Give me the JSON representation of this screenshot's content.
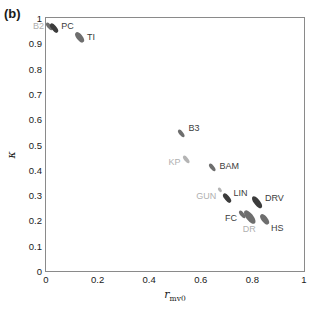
{
  "panel": {
    "label": "(b)"
  },
  "axes": {
    "xlabel_var": "r",
    "xlabel_sub": "mv0",
    "ylabel": "κ",
    "xticks": [
      "0",
      "0.2",
      "0.4",
      "0.6",
      "0.8",
      "1"
    ],
    "yticks": [
      "0",
      "0.1",
      "0.2",
      "0.3",
      "0.4",
      "0.5",
      "0.6",
      "0.7",
      "0.8",
      "0.9",
      "1"
    ]
  },
  "colors": {
    "frame": "#8a8a8a",
    "text": "#1a1a1a",
    "marker_dark": "#3c3c3c",
    "marker_mid": "#6e6e6e",
    "marker_light": "#b4b4b4",
    "label_dark": "#3c3c3c",
    "label_light": "#b0b0b0"
  },
  "chart_data": {
    "type": "scatter",
    "title": "",
    "xlabel": "r_mv0",
    "ylabel": "κ",
    "xlim": [
      0,
      1
    ],
    "ylim": [
      0,
      1
    ],
    "grid": false,
    "legend": "none",
    "points": [
      {
        "name": "B2",
        "x": 0.015,
        "y": 0.965,
        "size": 7,
        "shade": "mid",
        "label_dx": -17,
        "label_dy": -1,
        "label_shade": "light"
      },
      {
        "name": "PC",
        "x": 0.032,
        "y": 0.962,
        "size": 8,
        "shade": "dark",
        "label_dx": 7,
        "label_dy": -2,
        "label_shade": "dark"
      },
      {
        "name": "TI",
        "x": 0.128,
        "y": 0.921,
        "size": 9,
        "shade": "mid",
        "label_dx": 8,
        "label_dy": -1,
        "label_shade": "dark"
      },
      {
        "name": "B3",
        "x": 0.525,
        "y": 0.545,
        "size": 7,
        "shade": "mid",
        "label_dx": 7,
        "label_dy": -5,
        "label_shade": "dark"
      },
      {
        "name": "KP",
        "x": 0.545,
        "y": 0.442,
        "size": 7,
        "shade": "light",
        "label_dx": -18,
        "label_dy": 3,
        "label_shade": "light"
      },
      {
        "name": "BAM",
        "x": 0.645,
        "y": 0.41,
        "size": 7,
        "shade": "mid",
        "label_dx": 7,
        "label_dy": -1,
        "label_shade": "dark"
      },
      {
        "name": "GUN",
        "x": 0.675,
        "y": 0.32,
        "size": 4,
        "shade": "light",
        "label_dx": -24,
        "label_dy": 6,
        "label_shade": "light"
      },
      {
        "name": "LIN",
        "x": 0.7,
        "y": 0.288,
        "size": 8,
        "shade": "dark",
        "label_dx": 7,
        "label_dy": -5,
        "label_shade": "dark"
      },
      {
        "name": "DRV",
        "x": 0.818,
        "y": 0.272,
        "size": 10,
        "shade": "dark",
        "label_dx": 8,
        "label_dy": -4,
        "label_shade": "dark"
      },
      {
        "name": "FC",
        "x": 0.76,
        "y": 0.222,
        "size": 7,
        "shade": "mid",
        "label_dx": -17,
        "label_dy": 3,
        "label_shade": "dark"
      },
      {
        "name": "DR",
        "x": 0.79,
        "y": 0.215,
        "size": 12,
        "shade": "mid",
        "label_dx": -7,
        "label_dy": 12,
        "label_shade": "light"
      },
      {
        "name": "HS",
        "x": 0.845,
        "y": 0.205,
        "size": 9,
        "shade": "mid",
        "label_dx": 7,
        "label_dy": 9,
        "label_shade": "dark"
      }
    ]
  }
}
